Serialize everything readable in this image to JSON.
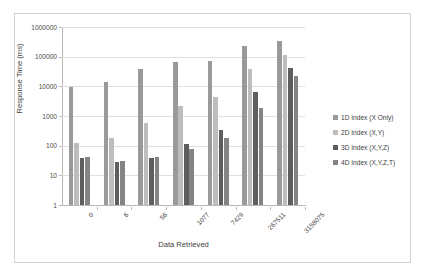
{
  "chart_data": {
    "type": "bar",
    "title": "",
    "xlabel": "Data Retrieved",
    "ylabel": "Response Time (ms)",
    "yscale": "log",
    "ylim": [
      1,
      1000000
    ],
    "yticks": [
      "1000000",
      "100000",
      "10000",
      "1000",
      "100",
      "10",
      "1"
    ],
    "grid": true,
    "legend_position": "right",
    "categories": [
      "0",
      "6",
      "56",
      "1077",
      "7429",
      "267511",
      "3158075"
    ],
    "series": [
      {
        "name": "1D Index (X Only)",
        "color": "#9a9a9a",
        "values": [
          9500,
          14000,
          37000,
          67000,
          73000,
          230000,
          350000
        ]
      },
      {
        "name": "2D Index (X,Y)",
        "color": "#bdbdbd",
        "values": [
          120,
          180,
          570,
          2200,
          4300,
          38000,
          110000
        ]
      },
      {
        "name": "3D Index (X,Y,Z)",
        "color": "#5e5e5e",
        "values": [
          38,
          29,
          37,
          110,
          350,
          6300,
          40000
        ]
      },
      {
        "name": "4D Index (X,Y,Z,T)",
        "color": "#848484",
        "values": [
          41,
          31,
          43,
          80,
          175,
          1800,
          22000
        ]
      }
    ]
  }
}
